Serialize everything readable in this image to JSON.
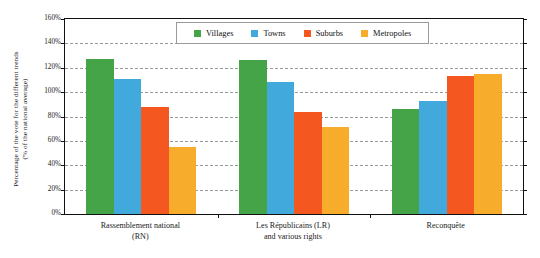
{
  "chart_data": {
    "type": "bar",
    "title": "",
    "subtitle": "",
    "xlabel": "",
    "ylabel": "Percentage of the vote for the different trends (% of the national average)",
    "ylabel_lines": [
      "Percentage of the vote for the different trends",
      "(% of the national average)"
    ],
    "categories": [
      "Rassemblement national (RN)",
      "Les Républicains (LR) and various rights",
      "Reconquête"
    ],
    "category_lines": [
      [
        "Rassemblement national",
        "(RN)"
      ],
      [
        "Les Républicains (LR)",
        "and various rights"
      ],
      [
        "Reconquête",
        ""
      ]
    ],
    "series": [
      {
        "name": "Villages",
        "color": "#45a348",
        "values": [
          127,
          126,
          86
        ]
      },
      {
        "name": "Towns",
        "color": "#42a9dd",
        "values": [
          111,
          108,
          93
        ]
      },
      {
        "name": "Suburbs",
        "color": "#f4571f",
        "values": [
          88,
          84,
          113
        ]
      },
      {
        "name": "Metropoles",
        "color": "#f7ad2b",
        "values": [
          55,
          71,
          115
        ]
      }
    ],
    "ylim": [
      0,
      160
    ],
    "ytick_step": 20,
    "ytick_labels": [
      "0%",
      "20%",
      "40%",
      "60%",
      "80%",
      "100%",
      "120%",
      "140%",
      "160%"
    ],
    "grid": true,
    "grid_style": "dashed",
    "grid_color": "#9a9a9a",
    "legend_position": "top-center",
    "legend_entries": [
      "Villages",
      "Towns",
      "Suburbs",
      "Metropoles"
    ],
    "plot_border_color": "#111111",
    "background_color": "#ffffff",
    "value_suffix": "%"
  }
}
